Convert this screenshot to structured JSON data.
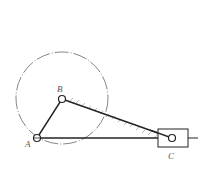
{
  "diagram": {
    "type": "slider-crank mechanism",
    "labels": {
      "A": "A",
      "B": "B",
      "C": "C"
    },
    "points": {
      "A": [
        37,
        138
      ],
      "B": [
        62,
        99
      ],
      "C": [
        172,
        138
      ]
    },
    "circle": {
      "center": [
        62,
        98
      ],
      "radius": 46,
      "style": "dash-dot"
    },
    "slider_block": {
      "x": 158,
      "y": 129,
      "width": 30,
      "height": 18
    },
    "guide_line": {
      "from": [
        37,
        138
      ],
      "to": [
        198,
        138
      ]
    },
    "colors": {
      "line": "#222222",
      "label": "#555555",
      "circle": "#666666"
    }
  }
}
